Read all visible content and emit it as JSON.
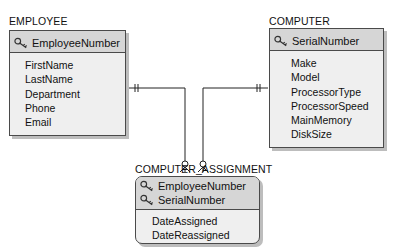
{
  "diagram": {
    "type": "entity-relationship (IE crow's foot)",
    "entities": [
      {
        "name": "EMPLOYEE",
        "keys": [
          "EmployeeNumber"
        ],
        "attributes": [
          "FirstName",
          "LastName",
          "Department",
          "Phone",
          "Email"
        ]
      },
      {
        "name": "COMPUTER",
        "keys": [
          "SerialNumber"
        ],
        "attributes": [
          "Make",
          "Model",
          "ProcessorType",
          "ProcessorSpeed",
          "MainMemory",
          "DiskSize"
        ]
      },
      {
        "name": "COMPUTER_ASSIGNMENT",
        "keys": [
          "EmployeeNumber",
          "SerialNumber"
        ],
        "attributes": [
          "DateAssigned",
          "DateReassigned"
        ]
      }
    ],
    "relationships": [
      {
        "from": "EMPLOYEE",
        "to": "COMPUTER_ASSIGNMENT",
        "from_cardinality": "mandatory-one",
        "to_cardinality": "optional-many"
      },
      {
        "from": "COMPUTER",
        "to": "COMPUTER_ASSIGNMENT",
        "from_cardinality": "mandatory-one",
        "to_cardinality": "optional-many"
      }
    ],
    "icons": {
      "key": "key-icon"
    },
    "colors": {
      "key_header": "#d6d6d6",
      "body": "#efefef",
      "border": "#4a4a4a",
      "shadow": "#bdbdbd"
    }
  }
}
